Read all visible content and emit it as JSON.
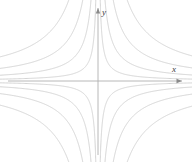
{
  "figure": {
    "title": "",
    "background_color": "#ffffff",
    "width": 192,
    "height": 162
  },
  "axes": {
    "x_axis": {
      "label": "x",
      "color": "#b0b0b0",
      "arrow": "right",
      "start_px": [
        8,
        81
      ],
      "end_px": [
        182,
        81
      ],
      "label_pos_px": [
        174,
        72
      ]
    },
    "y_axis": {
      "label": "y",
      "color": "#b0b0b0",
      "arrow": "up",
      "start_px": [
        98,
        155
      ],
      "end_px": [
        98,
        8
      ],
      "label_pos_px": [
        102,
        14
      ]
    },
    "origin_px": [
      98,
      81
    ]
  },
  "chart_data": {
    "type": "line",
    "title": "",
    "xlabel": "x",
    "ylabel": "y",
    "xlim": [
      -4.2,
      4.2
    ],
    "ylim": [
      -3.6,
      3.6
    ],
    "grid": false,
    "legend": null,
    "equation": "x*y = c",
    "curve_color": "#cfcfcf",
    "curve_width": 0.9,
    "series": [
      {
        "name": "xy = 0.35",
        "c": 0.35,
        "quadrants": [
          1,
          3
        ]
      },
      {
        "name": "xy = 1.1",
        "c": 1.1,
        "quadrants": [
          1,
          3
        ]
      },
      {
        "name": "xy = 2.4",
        "c": 2.4,
        "quadrants": [
          1,
          3
        ]
      },
      {
        "name": "xy = 4.6",
        "c": 4.6,
        "quadrants": [
          1,
          3
        ]
      },
      {
        "name": "xy = -0.35",
        "c": -0.35,
        "quadrants": [
          2,
          4
        ]
      },
      {
        "name": "xy = -1.1",
        "c": -1.1,
        "quadrants": [
          2,
          4
        ]
      },
      {
        "name": "xy = -2.4",
        "c": -2.4,
        "quadrants": [
          2,
          4
        ]
      },
      {
        "name": "xy = -4.6",
        "c": -4.6,
        "quadrants": [
          2,
          4
        ]
      }
    ],
    "levels": [
      0.35,
      1.1,
      2.4,
      4.6
    ],
    "annotations": []
  }
}
